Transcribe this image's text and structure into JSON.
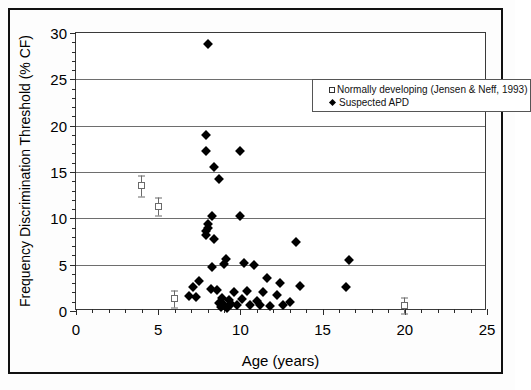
{
  "chart_data": {
    "type": "scatter",
    "title": "",
    "xlabel": "Age (years)",
    "ylabel": "Frequency Discrimination Threshold (% CF)",
    "xlim": [
      0,
      25
    ],
    "ylim": [
      0,
      30
    ],
    "xticks": [
      0,
      5,
      10,
      15,
      20,
      25
    ],
    "xtick_labels": [
      "0",
      "5",
      "10",
      "15",
      "20",
      "25"
    ],
    "yticks": [
      0,
      5,
      10,
      15,
      20,
      25,
      30
    ],
    "ytick_labels": [
      "0",
      "5",
      "10",
      "15",
      "20",
      "25",
      "30"
    ],
    "x_minor_tick_interval": 1,
    "y_minor_tick_interval": 1,
    "grid": "horizontal-major",
    "legend_position": "top-right-inside",
    "series": [
      {
        "name": "Normally developing (Jensen & Neff, 1993)",
        "marker": "open-square",
        "color": "#6a6a6a",
        "has_error_bars": true,
        "points": [
          {
            "x": 4.0,
            "y": 13.5,
            "err": 1.1
          },
          {
            "x": 5.0,
            "y": 11.3,
            "err": 1.0
          },
          {
            "x": 6.0,
            "y": 1.3,
            "err": 0.9
          },
          {
            "x": 20.0,
            "y": 0.6,
            "err": 0.9
          }
        ]
      },
      {
        "name": "Suspected APD",
        "marker": "filled-diamond",
        "color": "#000000",
        "has_error_bars": false,
        "points": [
          {
            "x": 8.0,
            "y": 28.8
          },
          {
            "x": 7.9,
            "y": 19.0
          },
          {
            "x": 7.9,
            "y": 17.3
          },
          {
            "x": 10.0,
            "y": 17.3
          },
          {
            "x": 8.4,
            "y": 15.5
          },
          {
            "x": 8.7,
            "y": 14.2
          },
          {
            "x": 8.3,
            "y": 10.3
          },
          {
            "x": 10.0,
            "y": 10.3
          },
          {
            "x": 8.0,
            "y": 9.4
          },
          {
            "x": 8.0,
            "y": 9.0
          },
          {
            "x": 7.9,
            "y": 8.6
          },
          {
            "x": 7.9,
            "y": 8.2
          },
          {
            "x": 8.4,
            "y": 7.8
          },
          {
            "x": 13.4,
            "y": 7.4
          },
          {
            "x": 9.1,
            "y": 5.6
          },
          {
            "x": 9.0,
            "y": 5.1
          },
          {
            "x": 16.6,
            "y": 5.5
          },
          {
            "x": 10.2,
            "y": 5.2
          },
          {
            "x": 10.8,
            "y": 5.0
          },
          {
            "x": 8.3,
            "y": 4.7
          },
          {
            "x": 11.6,
            "y": 3.6
          },
          {
            "x": 7.5,
            "y": 3.2
          },
          {
            "x": 12.4,
            "y": 3.0
          },
          {
            "x": 7.1,
            "y": 2.6
          },
          {
            "x": 13.6,
            "y": 2.7
          },
          {
            "x": 16.4,
            "y": 2.6
          },
          {
            "x": 8.2,
            "y": 2.4
          },
          {
            "x": 8.6,
            "y": 2.3
          },
          {
            "x": 10.4,
            "y": 2.2
          },
          {
            "x": 9.6,
            "y": 2.0
          },
          {
            "x": 11.4,
            "y": 2.0
          },
          {
            "x": 12.2,
            "y": 1.7
          },
          {
            "x": 6.9,
            "y": 1.6
          },
          {
            "x": 7.3,
            "y": 1.5
          },
          {
            "x": 8.9,
            "y": 1.4
          },
          {
            "x": 9.3,
            "y": 1.2
          },
          {
            "x": 10.1,
            "y": 1.3
          },
          {
            "x": 11.0,
            "y": 1.1
          },
          {
            "x": 13.0,
            "y": 1.0
          },
          {
            "x": 8.7,
            "y": 0.9
          },
          {
            "x": 9.0,
            "y": 0.7
          },
          {
            "x": 9.4,
            "y": 0.8
          },
          {
            "x": 9.8,
            "y": 0.6
          },
          {
            "x": 10.6,
            "y": 0.6
          },
          {
            "x": 11.2,
            "y": 0.7
          },
          {
            "x": 11.8,
            "y": 0.5
          },
          {
            "x": 12.6,
            "y": 0.6
          },
          {
            "x": 8.8,
            "y": 0.4
          },
          {
            "x": 9.2,
            "y": 0.3
          }
        ]
      }
    ]
  },
  "legend": {
    "entries": [
      {
        "label": "Normally developing (Jensen & Neff, 1993)",
        "marker": "open-square"
      },
      {
        "label": "Suspected APD",
        "marker": "filled-diamond"
      }
    ]
  }
}
